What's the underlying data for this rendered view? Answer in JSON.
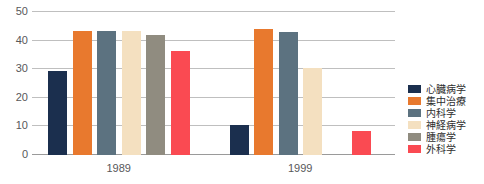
{
  "chart_data": {
    "type": "bar",
    "title": "",
    "xlabel": "",
    "ylabel": "",
    "categories": [
      "1989",
      "1999"
    ],
    "ylim": [
      0,
      50
    ],
    "yticks": [
      0,
      10,
      20,
      30,
      40,
      50
    ],
    "grid": true,
    "legend_position": "right",
    "series": [
      {
        "name": "心臓病学",
        "color": "#1b2f4e",
        "values": [
          29.5,
          10.5
        ]
      },
      {
        "name": "集中治療",
        "color": "#e8792e",
        "values": [
          43.5,
          44.0
        ]
      },
      {
        "name": "内科学",
        "color": "#5c7280",
        "values": [
          43.5,
          43.0
        ]
      },
      {
        "name": "神経病学",
        "color": "#f4e0c0",
        "values": [
          43.5,
          30.5
        ]
      },
      {
        "name": "腫瘍学",
        "color": "#908c80",
        "values": [
          42.0,
          0
        ]
      },
      {
        "name": "外科学",
        "color": "#fa4a52",
        "values": [
          36.5,
          8.5
        ]
      }
    ]
  },
  "axis": {
    "ytick_labels": [
      "0",
      "10",
      "20",
      "30",
      "40",
      "50"
    ],
    "xtick_labels": [
      "1989",
      "1999"
    ]
  },
  "legend": {
    "items": [
      {
        "label": "心臓病学",
        "swatch": "#1b2f4e"
      },
      {
        "label": "集中治療",
        "swatch": "#e8792e"
      },
      {
        "label": "内科学",
        "swatch": "#5c7280"
      },
      {
        "label": "神経病学",
        "swatch": "#f4e0c0"
      },
      {
        "label": "腫瘍学",
        "swatch": "#908c80"
      },
      {
        "label": "外科学",
        "swatch": "#fa4a52"
      }
    ]
  },
  "colors": {
    "gridline": "#bfbfbf",
    "axis": "#9a9a9a",
    "tick_text": "#58585a",
    "legend_text": "#2e2e2e",
    "background": "#ffffff"
  }
}
